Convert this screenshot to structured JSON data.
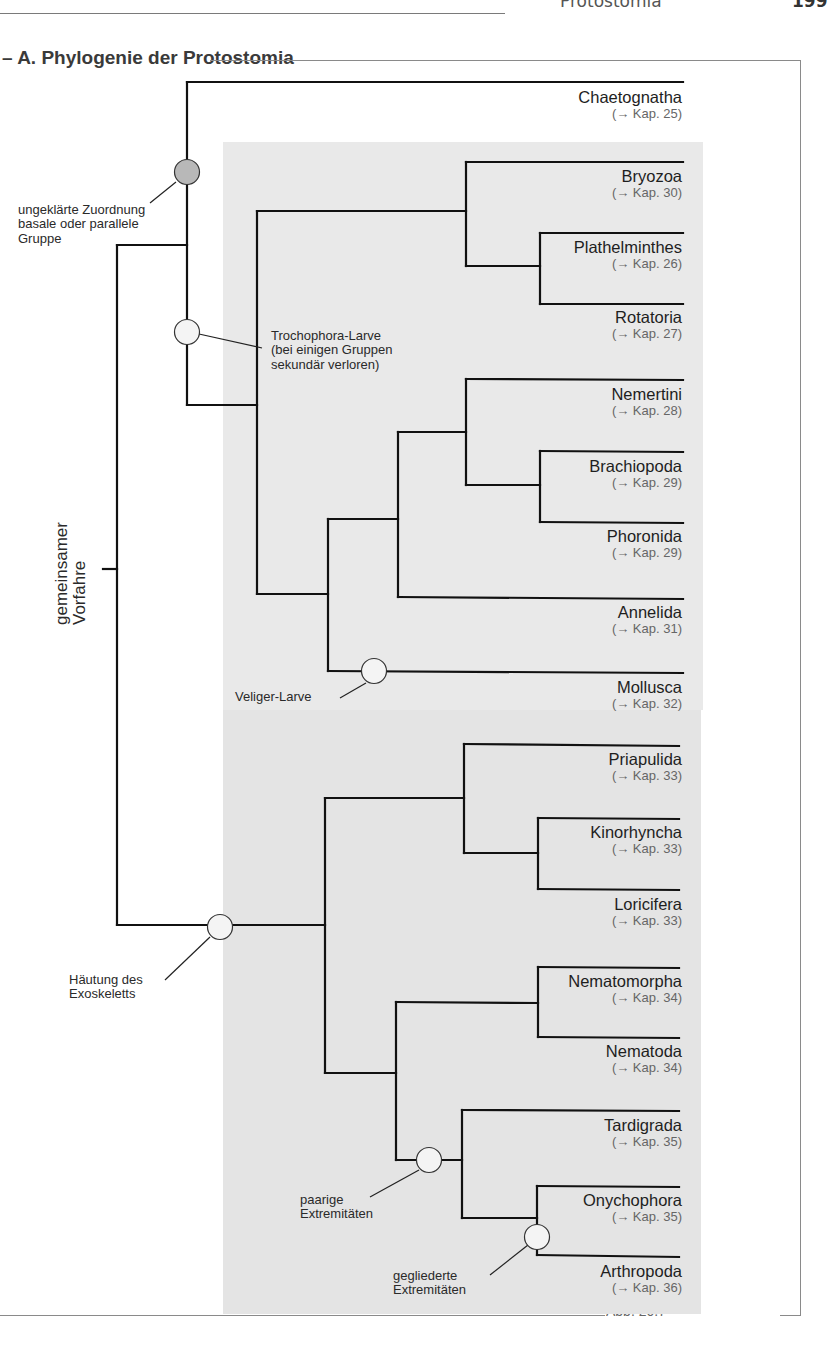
{
  "header": {
    "running_title": "Protostomia",
    "page_number": "199"
  },
  "section": {
    "title": "– A. Phylogenie der Protostomia"
  },
  "figure": {
    "label": "Abb. 20.7"
  },
  "root": {
    "label_line1": "gemeinsamer",
    "label_line2": "Vorfahre"
  },
  "taxa": [
    {
      "name": "Chaetognatha",
      "ref": "(→ Kap. 25)"
    },
    {
      "name": "Bryozoa",
      "ref": "(→ Kap. 30)"
    },
    {
      "name": "Plathelminthes",
      "ref": "(→ Kap. 26)"
    },
    {
      "name": "Rotatoria",
      "ref": "(→ Kap. 27)"
    },
    {
      "name": "Nemertini",
      "ref": "(→ Kap. 28)"
    },
    {
      "name": "Brachiopoda",
      "ref": "(→ Kap. 29)"
    },
    {
      "name": "Phoronida",
      "ref": "(→ Kap. 29)"
    },
    {
      "name": "Annelida",
      "ref": "(→ Kap. 31)"
    },
    {
      "name": "Mollusca",
      "ref": "(→ Kap. 32)"
    },
    {
      "name": "Priapulida",
      "ref": "(→ Kap. 33)"
    },
    {
      "name": "Kinorhyncha",
      "ref": "(→ Kap. 33)"
    },
    {
      "name": "Loricifera",
      "ref": "(→ Kap. 33)"
    },
    {
      "name": "Nematomorpha",
      "ref": "(→ Kap. 34)"
    },
    {
      "name": "Nematoda",
      "ref": "(→ Kap. 34)"
    },
    {
      "name": "Tardigrada",
      "ref": "(→ Kap. 35)"
    },
    {
      "name": "Onychophora",
      "ref": "(→ Kap. 35)"
    },
    {
      "name": "Arthropoda",
      "ref": "(→ Kap. 36)"
    }
  ],
  "annotations": {
    "unclear": {
      "line1": "ungeklärte Zuordnung",
      "line2": "basale oder parallele",
      "line3": "Gruppe"
    },
    "trochophora": {
      "line1": "Trochophora-Larve",
      "line2": "(bei einigen Gruppen",
      "line3": "sekundär verloren)"
    },
    "veliger": {
      "line1": "Veliger-Larve"
    },
    "moulting": {
      "line1": "Häutung des",
      "line2": "Exoskeletts"
    },
    "paired_limbs": {
      "line1": "paarige",
      "line2": "Extremitäten"
    },
    "jointed_limbs": {
      "line1": "gegliederte",
      "line2": "Extremitäten"
    }
  },
  "colors": {
    "line": "#111111",
    "gray_node": "#b8b8b8",
    "white_node": "#f4f4f4",
    "panel_upper": "#e9e9e9",
    "panel_lower": "#e4e4e4"
  }
}
